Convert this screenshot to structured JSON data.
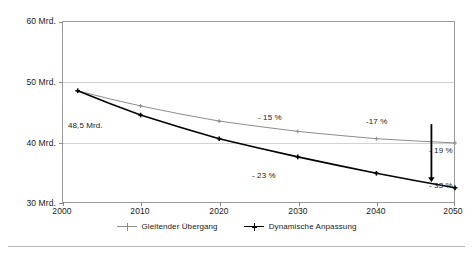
{
  "chart_data": {
    "type": "line",
    "title": "",
    "subtitle": "",
    "xlabel": "",
    "ylabel": "",
    "xlim": [
      2000,
      2050
    ],
    "ylim": [
      30,
      60
    ],
    "grid": true,
    "legend_position": "bottom-center",
    "x_ticks": [
      "2000",
      "2010",
      "2020",
      "2030",
      "2040",
      "2050"
    ],
    "x_tick_values": [
      2000,
      2010,
      2020,
      2030,
      2040,
      2050
    ],
    "y_ticks": [
      "30 Mrd.",
      "40 Mrd.",
      "50 Mrd.",
      "60 Mrd."
    ],
    "y_tick_values": [
      30,
      40,
      50,
      60
    ],
    "series": [
      {
        "name": "Gleitender Übergang",
        "color": "#8c8c8c",
        "x": [
          2002,
          2010,
          2020,
          2030,
          2040,
          2050
        ],
        "values": [
          48.5,
          46.0,
          43.5,
          41.8,
          40.6,
          39.9
        ]
      },
      {
        "name": "Dynamische Anpassung",
        "color": "#000000",
        "x": [
          2002,
          2010,
          2020,
          2030,
          2040,
          2050
        ],
        "values": [
          48.5,
          44.5,
          40.6,
          37.6,
          34.9,
          32.5
        ]
      }
    ],
    "annotations": [
      {
        "text": "48,5 Mrd.",
        "x": 2008,
        "y": 44.3
      },
      {
        "text": "- 15 %",
        "x": 2031,
        "y": 44.0
      },
      {
        "text": "- 23 %",
        "x": 2029,
        "y": 34.7
      },
      {
        "text": "-17 %",
        "x": 2046,
        "y": 43.4
      },
      {
        "text": "- 19 %",
        "x": 2054,
        "y": 39.6
      },
      {
        "text": "- 33 %",
        "x": 2054,
        "y": 33.8
      }
    ],
    "arrow": {
      "name": "gap-arrow",
      "x": 2047,
      "y_start": 43.0,
      "y_end": 33.4,
      "color": "#000000"
    }
  },
  "legend": {
    "items": [
      {
        "label": "Gleitender Übergang",
        "marker": "line-plus-marker-gray"
      },
      {
        "label": "Dynamische Anpassung",
        "marker": "line-plus-marker-black"
      }
    ]
  },
  "colors": {
    "series_gray": "#8c8c8c",
    "series_black": "#000000",
    "grid": "#d2d2d2",
    "frame": "#9a9a9a",
    "background": "#ffffff"
  }
}
